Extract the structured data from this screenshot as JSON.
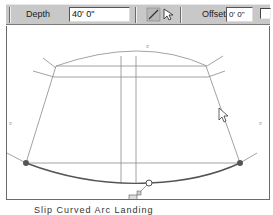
{
  "toolbar": {
    "depth_label": "Depth",
    "depth_value": "40' 0\"",
    "offset_label": "Offset:",
    "offset_value": "0' 0\"",
    "tools": [
      "pencil-tool",
      "arrow-select-tool"
    ],
    "checkbox_checked": false
  },
  "canvas": {
    "line_color": "#8a8a8a",
    "arc_color": "#555555",
    "handle_color": "#555555",
    "markers": [
      "top-marker",
      "left-marker",
      "right-marker",
      "bottom-marker"
    ]
  },
  "caption": {
    "text": "Slip Curved Arc Landing"
  }
}
